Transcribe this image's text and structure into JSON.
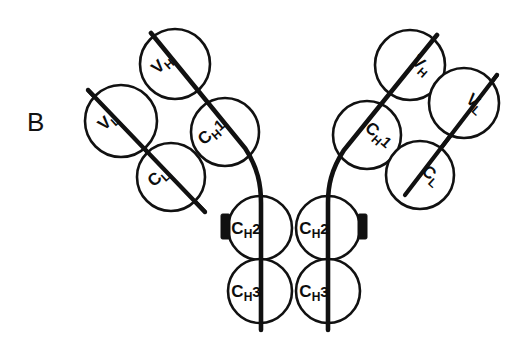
{
  "figure": {
    "panel_letter": "B",
    "background_color": "#ffffff",
    "line_color": "#111111",
    "description_type": "antibody-domain-schematic"
  },
  "domains": {
    "left_arm": [
      {
        "id": "left-vh",
        "base": "V",
        "sub": "H",
        "sup": "",
        "cx": 175,
        "cy": 64,
        "r": 35,
        "rotation": -42
      },
      {
        "id": "left-vl",
        "base": "V",
        "sub": "L",
        "sup": "",
        "cx": 121,
        "cy": 121,
        "r": 36,
        "rotation": -42
      },
      {
        "id": "left-ch1",
        "base": "C",
        "sub": "H",
        "sup": "1",
        "cx": 225,
        "cy": 132,
        "r": 34,
        "rotation": -42
      },
      {
        "id": "left-cl",
        "base": "C",
        "sub": "L",
        "sup": "",
        "cx": 171,
        "cy": 177,
        "r": 34,
        "rotation": -42
      }
    ],
    "right_arm": [
      {
        "id": "right-vh",
        "base": "V",
        "sub": "H",
        "sup": "",
        "cx": 410,
        "cy": 65,
        "r": 35,
        "rotation": 42
      },
      {
        "id": "right-vl",
        "base": "V",
        "sub": "L",
        "sup": "",
        "cx": 464,
        "cy": 103,
        "r": 35,
        "rotation": 42
      },
      {
        "id": "right-ch1",
        "base": "C",
        "sub": "H",
        "sup": "1",
        "cx": 367,
        "cy": 135,
        "r": 34,
        "rotation": 42
      },
      {
        "id": "right-cl",
        "base": "C",
        "sub": "L",
        "sup": "",
        "cx": 420,
        "cy": 175,
        "r": 34,
        "rotation": 42
      }
    ],
    "stem": [
      {
        "id": "left-ch2",
        "base": "C",
        "sub": "H",
        "sup": "2",
        "cx": 260,
        "cy": 228,
        "r": 32,
        "rotation": 0
      },
      {
        "id": "right-ch2",
        "base": "C",
        "sub": "H",
        "sup": "2",
        "cx": 328,
        "cy": 228,
        "r": 32,
        "rotation": 0
      },
      {
        "id": "left-ch3",
        "base": "C",
        "sub": "H",
        "sup": "3",
        "cx": 260,
        "cy": 291,
        "r": 32,
        "rotation": 0
      },
      {
        "id": "right-ch3",
        "base": "C",
        "sub": "H",
        "sup": "3",
        "cx": 328,
        "cy": 291,
        "r": 32,
        "rotation": 0
      }
    ]
  },
  "chains": {
    "left_heavy_path": "M 151 33 L 245 148 C 258 168 261 185 261 203 L 261 330",
    "right_heavy_path": "M 437 35 L 344 150 C 331 170 328 186 328 203 L 328 330",
    "left_light_path": "M 88 90 L 205 212",
    "right_light_path": "M 497 75 L 405 195"
  },
  "hinge_tabs": [
    {
      "id": "left-hinge-tab",
      "x": 221,
      "y": 214,
      "width": 9,
      "height": 25
    },
    {
      "id": "right-hinge-tab",
      "x": 358,
      "y": 214,
      "width": 9,
      "height": 25
    }
  ],
  "labels": {
    "panel": "B",
    "vh": "V",
    "vl": "V",
    "cl": "C",
    "ch1": "C",
    "ch2": "C",
    "ch3": "C",
    "sub_h": "H",
    "sub_l": "L",
    "sup_1": "1",
    "sup_2": "2",
    "sup_3": "3"
  }
}
